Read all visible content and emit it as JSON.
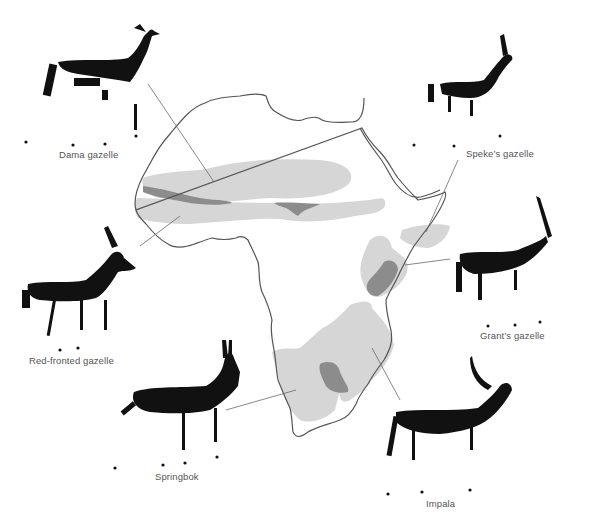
{
  "figure": {
    "colors": {
      "background": "#ffffff",
      "coastline": "#555555",
      "range_light": "#d6d6d6",
      "range_dark": "#8c8c8c",
      "animal_fill": "#111111",
      "leader_line": "#6a6a6a",
      "label_text": "#555555"
    }
  },
  "species": [
    {
      "id": "dama",
      "label": "Dama gazelle",
      "label_pos": [
        59,
        155
      ]
    },
    {
      "id": "speke",
      "label": "Speke’s gazelle",
      "label_pos": [
        466,
        150
      ]
    },
    {
      "id": "red-fronted",
      "label": "Red-fronted gazelle",
      "label_pos": [
        29,
        361
      ]
    },
    {
      "id": "grant",
      "label": "Grant’s gazelle",
      "label_pos": [
        480,
        336
      ]
    },
    {
      "id": "springbok",
      "label": "Springbok",
      "label_pos": [
        155,
        476
      ]
    },
    {
      "id": "impala",
      "label": "Impala",
      "label_pos": [
        426,
        504
      ]
    }
  ]
}
